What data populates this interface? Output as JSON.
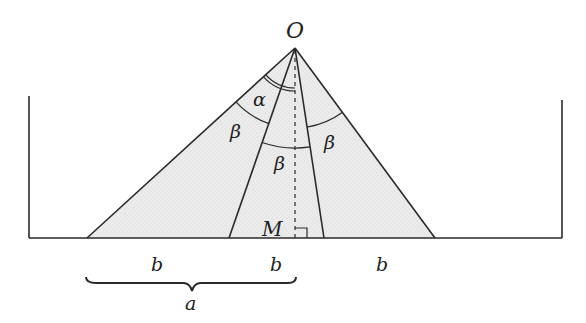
{
  "diagram": {
    "apex_label": "O",
    "foot_label": "M",
    "alpha_label": "α",
    "beta_labels": [
      "β",
      "β",
      "β"
    ],
    "segment_labels": [
      "b",
      "b",
      "b"
    ],
    "brace_label": "a",
    "colors": {
      "stroke": "#2a2a2a",
      "fill": "#e6e6e6",
      "background": "#ffffff"
    }
  }
}
